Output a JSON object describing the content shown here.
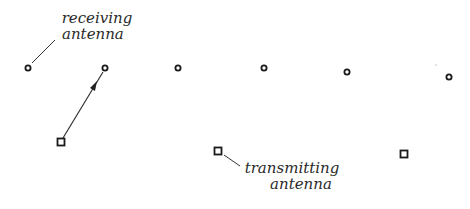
{
  "diagram": {
    "labels": {
      "receiving": {
        "line1": "receiving",
        "line2": "antenna"
      },
      "transmitting": {
        "line1": "transmitting",
        "line2": "antenna"
      }
    },
    "receiving_antennas": [
      {
        "x": 28,
        "y": 68
      },
      {
        "x": 105,
        "y": 68
      },
      {
        "x": 178,
        "y": 68
      },
      {
        "x": 264,
        "y": 68
      },
      {
        "x": 347,
        "y": 72
      },
      {
        "x": 449,
        "y": 77
      }
    ],
    "transmitting_antennas": [
      {
        "x": 61,
        "y": 142
      },
      {
        "x": 218,
        "y": 151
      },
      {
        "x": 404,
        "y": 154
      }
    ],
    "signal_path": {
      "from": {
        "x": 61,
        "y": 142
      },
      "to": {
        "x": 105,
        "y": 68
      }
    },
    "colors": {
      "stroke": "#222222",
      "background": "#ffffff"
    }
  }
}
